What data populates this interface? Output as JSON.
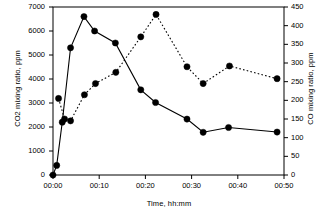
{
  "chart_data": {
    "type": "line",
    "title": "",
    "xlabel": "Time, hh:mm",
    "ylabel": "CO2 mixing ratio, ppm",
    "ylabel_right": "CO mixing ratio, ppm",
    "xlim": [
      0,
      50
    ],
    "ylim": [
      0,
      7000
    ],
    "ylim_right": [
      0,
      450
    ],
    "grid": false,
    "legend": "none",
    "xticks": [
      0,
      10,
      20,
      30,
      40,
      50
    ],
    "xtick_labels": [
      "00:00",
      "00:10",
      "00:20",
      "00:30",
      "00:40",
      "00:50"
    ],
    "yticks_left": [
      0,
      1000,
      2000,
      3000,
      4000,
      5000,
      6000,
      7000
    ],
    "ytick_labels_left": [
      "0",
      "1000",
      "2000",
      "3000",
      "4000",
      "5000",
      "6000",
      "7000"
    ],
    "yticks_right": [
      0,
      50,
      100,
      150,
      200,
      250,
      300,
      350,
      400,
      450
    ],
    "ytick_labels_right": [
      "0",
      "50",
      "100",
      "150",
      "200",
      "250",
      "300",
      "350",
      "400",
      "450"
    ],
    "series": [
      {
        "name": "CO2 mixing ratio, ppm",
        "axis": "left",
        "line_style": "solid",
        "marker": "filled-circle",
        "color": "#000000",
        "x": [
          0,
          0.8,
          2.0,
          3.8,
          6.7,
          9.0,
          13.5,
          19.0,
          22.2,
          29.0,
          32.5,
          38.0,
          48.5
        ],
        "values": [
          0,
          400,
          2200,
          5300,
          6600,
          6000,
          5500,
          3550,
          3020,
          2330,
          1780,
          1980,
          1790
        ]
      },
      {
        "name": "CO mixing ratio, ppm",
        "axis": "right",
        "line_style": "dotted",
        "marker": "filled-circle",
        "color": "#000000",
        "x": [
          1.2,
          2.5,
          3.8,
          6.8,
          9.2,
          13.6,
          19.0,
          22.3,
          29.0,
          32.5,
          38.2,
          48.5
        ],
        "values": [
          205,
          150,
          145,
          215,
          245,
          275,
          370,
          430,
          290,
          245,
          292,
          258
        ]
      }
    ]
  },
  "axes": {
    "xlabel": "Time, hh:mm",
    "ylabel_left": "CO2 mixing ratio, ppm",
    "ylabel_right": "CO mixing ratio, ppm"
  }
}
